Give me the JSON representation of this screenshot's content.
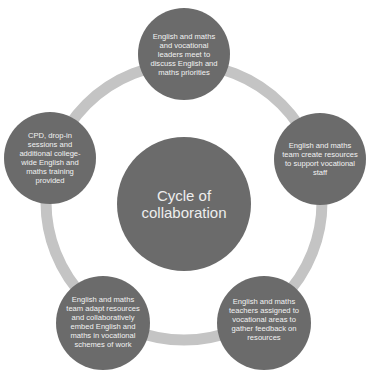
{
  "diagram": {
    "title": "Cycle of collaboration",
    "colors": {
      "node_fill": "#6b6b6b",
      "ring": "#c4c4c4",
      "text": "#f2f2f2",
      "background": "#ffffff"
    },
    "center": {
      "label": "Cycle of collaboration"
    },
    "steps": [
      {
        "position": "top",
        "label": "English and maths and vocational leaders meet to discuss English and maths priorities"
      },
      {
        "position": "right",
        "label": "English and maths team create resources to support vocational staff"
      },
      {
        "position": "bottom-right",
        "label": "English and maths teachers assigned to vocational areas to gather feedback on resources"
      },
      {
        "position": "bottom-left",
        "label": "English and maths team adapt resources and collaboratively embed English and maths in vocational schemes of work"
      },
      {
        "position": "left",
        "label": "CPD, drop-in sessions and additional college-wide English and maths training provided"
      }
    ]
  }
}
